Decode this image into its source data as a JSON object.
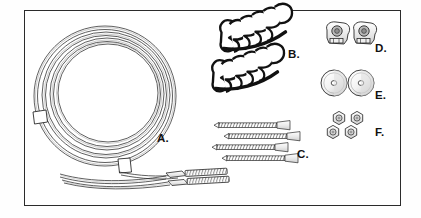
{
  "figure": {
    "background_color": "#ffffff",
    "border_color": "#2b2b2b",
    "ink_color": "#1a1a1a",
    "shade_color": "#d8d8d8"
  },
  "labels": [
    {
      "key": "A",
      "text": "A.",
      "x": 157,
      "y": 133,
      "part": "coiled-cable"
    },
    {
      "key": "B",
      "text": "B.",
      "x": 288,
      "y": 49,
      "part": "spiral-clips"
    },
    {
      "key": "C",
      "text": "C.",
      "x": 297,
      "y": 149,
      "part": "screws"
    },
    {
      "key": "D",
      "text": "D.",
      "x": 375,
      "y": 43,
      "part": "mounting-brackets"
    },
    {
      "key": "E",
      "text": "E.",
      "x": 375,
      "y": 90,
      "part": "washers"
    },
    {
      "key": "F",
      "text": "F.",
      "x": 375,
      "y": 127,
      "part": "hex-nuts"
    }
  ],
  "parts": {
    "cable": {
      "label": "A",
      "description": "Coiled braided cable with two ties and two threaded end terminals",
      "coil_center_x": 105,
      "coil_center_y": 95,
      "coil_outer_radius": 72,
      "coil_inner_radius": 50,
      "strand_count": 7,
      "tie_count": 2,
      "terminal_count": 2
    },
    "clips": {
      "label": "B",
      "description": "Two helical spiral cable clips",
      "count": 2,
      "positions": [
        {
          "x": 252,
          "y": 40,
          "rotation": -16
        },
        {
          "x": 243,
          "y": 80,
          "rotation": -16
        }
      ]
    },
    "screws": {
      "label": "C",
      "description": "Four flat-head threaded wood screws",
      "count": 4,
      "rows": [
        {
          "x": 215,
          "y": 125,
          "length": 76
        },
        {
          "x": 225,
          "y": 136,
          "length": 76
        },
        {
          "x": 213,
          "y": 147,
          "length": 76
        },
        {
          "x": 223,
          "y": 158,
          "length": 76
        }
      ]
    },
    "brackets": {
      "label": "D",
      "description": "Two angled mounting brackets with center holes",
      "count": 2,
      "positions": [
        {
          "x": 334,
          "y": 35
        },
        {
          "x": 360,
          "y": 35
        }
      ]
    },
    "washers": {
      "label": "E",
      "description": "Two round flat washers with center holes",
      "count": 2,
      "positions": [
        {
          "x": 334,
          "y": 83
        },
        {
          "x": 361,
          "y": 83
        }
      ],
      "radius": 13
    },
    "nuts": {
      "label": "F",
      "description": "Four hexagonal nuts",
      "count": 4,
      "positions": [
        {
          "x": 339,
          "y": 118
        },
        {
          "x": 357,
          "y": 118
        },
        {
          "x": 333,
          "y": 132
        },
        {
          "x": 351,
          "y": 132
        }
      ],
      "radius": 6.5
    }
  }
}
